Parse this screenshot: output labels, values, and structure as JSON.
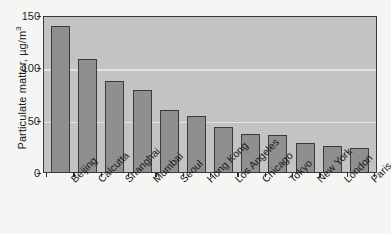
{
  "chart_data": {
    "type": "bar",
    "title": "",
    "subtitle": "",
    "xlabel": "",
    "ylabel": "Particulate matter, µg/m",
    "ylabel_exponent": "3",
    "ylim": [
      0,
      150
    ],
    "yticks": [
      0,
      50,
      100,
      150
    ],
    "ytick_labels": [
      "0",
      "50",
      "100",
      "150"
    ],
    "grid": "horizontal",
    "legend": "none",
    "categories": [
      "Beijing",
      "Calcutta",
      "Shanghai",
      "Mumbai",
      "Seoul",
      "Hong Kong",
      "Los Angeles",
      "Chicago",
      "Tokyo",
      "New York",
      "London",
      "Paris"
    ],
    "values": [
      142,
      110,
      89,
      80,
      60,
      55,
      44,
      37,
      36,
      28,
      25,
      23
    ],
    "bar_fill_color": "#8f8f8f",
    "bar_edge_color": "#3a3a3a",
    "plot_background_color": "#c3c3c3",
    "gridline_color": "#e3e3e1",
    "figure_background_color": "#f5f5f3",
    "text_color": "#1b1b1b"
  }
}
